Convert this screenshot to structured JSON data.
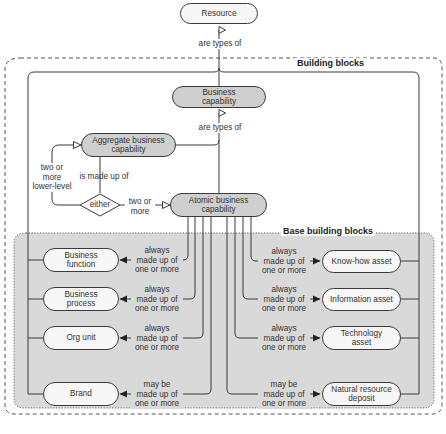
{
  "diagram": {
    "colors": {
      "line": "#3a3a3a",
      "node_light_fill": "#f7f7f7",
      "node_dark_fill": "#cfcfcf",
      "base_region_fill": "#d9d9d9",
      "text": "#333333"
    },
    "groups": {
      "building_blocks": "Building blocks",
      "base_building_blocks": "Base building blocks"
    },
    "nodes": {
      "resource": "Resource",
      "business_capability": "Business\ncapability",
      "aggregate": "Aggregate business\ncapability",
      "atomic": "Atomic business\ncapability",
      "either": "either",
      "business_function": "Business\nfunction",
      "business_process": "Business\nprocess",
      "org_unit": "Org unit",
      "brand": "Brand",
      "know_how_asset": "Know-how asset",
      "information_asset": "Information asset",
      "technology_asset": "Technology\nasset",
      "natural_resource_deposit": "Natural resource\ndeposit"
    },
    "edges": {
      "are_types_of_top": "are types of",
      "are_types_of_mid": "are types of",
      "is_made_up_of": "is made up of",
      "two_or_more_lower_level": "two or\nmore\nlower-level",
      "two_or_more": "two or\nmore",
      "business_function": "always\nmade up of\none or more",
      "business_process": "always\nmade up of\none or more",
      "org_unit": "always\nmade up of\none or more",
      "brand": "may be\nmade up of\none or more",
      "know_how_asset": "always\nmade up of\none or more",
      "information_asset": "always\nmade up of\none or more",
      "technology_asset": "always\nmade up of\none or more",
      "natural_resource_deposit": "may be\nmade up of\none or more"
    }
  }
}
